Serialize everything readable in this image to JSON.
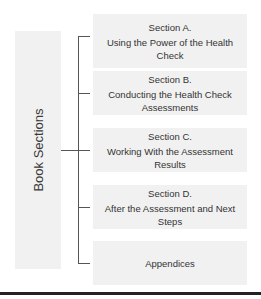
{
  "diagram": {
    "root_label": "Book Sections",
    "sections": [
      {
        "title": "Section A.",
        "subtitle": "Using the Power of the Health Check"
      },
      {
        "title": "Section B.",
        "subtitle": "Conducting the Health Check Assessments"
      },
      {
        "title": "Section C.",
        "subtitle": "Working With the Assessment Results"
      },
      {
        "title": "Section D.",
        "subtitle": "After the Assessment and Next Steps"
      },
      {
        "title": "",
        "subtitle": "Appendices"
      }
    ]
  }
}
